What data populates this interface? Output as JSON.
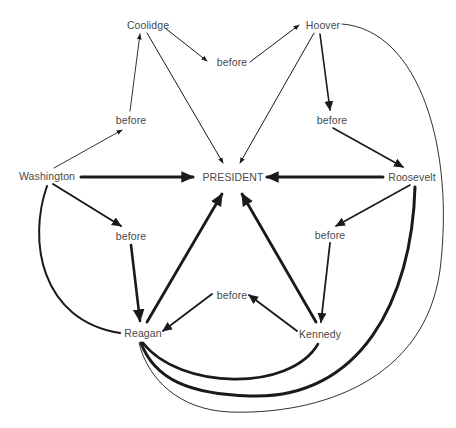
{
  "diagram": {
    "type": "semantic-network",
    "center_node": "PRESIDENT",
    "nodes": [
      {
        "id": "coolidge",
        "label": "Coolidge",
        "x": 148,
        "y": 25
      },
      {
        "id": "hoover",
        "label": "Hoover",
        "x": 323,
        "y": 25
      },
      {
        "id": "before_top",
        "label": "before",
        "x": 232,
        "y": 62
      },
      {
        "id": "before_left",
        "label": "before",
        "x": 131,
        "y": 120
      },
      {
        "id": "before_right",
        "label": "before",
        "x": 332,
        "y": 120
      },
      {
        "id": "washington",
        "label": "Washington",
        "x": 47,
        "y": 176
      },
      {
        "id": "president",
        "label": "PRESIDENT",
        "x": 233,
        "y": 177
      },
      {
        "id": "roosevelt",
        "label": "Roosevelt",
        "x": 412,
        "y": 177
      },
      {
        "id": "before_lower_left",
        "label": "before",
        "x": 131,
        "y": 236
      },
      {
        "id": "before_lower_right",
        "label": "before",
        "x": 330,
        "y": 235
      },
      {
        "id": "before_bottom",
        "label": "before",
        "x": 232,
        "y": 295
      },
      {
        "id": "reagan",
        "label": "Reagan",
        "x": 143,
        "y": 333
      },
      {
        "id": "kennedy",
        "label": "Kennedy",
        "x": 320,
        "y": 334
      }
    ],
    "edges": [
      {
        "from": "coolidge",
        "to": "before_top",
        "weight": "thin"
      },
      {
        "from": "before_top",
        "to": "hoover",
        "weight": "thin"
      },
      {
        "from": "coolidge",
        "to": "president",
        "weight": "thin"
      },
      {
        "from": "hoover",
        "to": "president",
        "weight": "thin"
      },
      {
        "from": "washington",
        "to": "before_left",
        "weight": "thin"
      },
      {
        "from": "before_left",
        "to": "coolidge",
        "weight": "thin"
      },
      {
        "from": "hoover",
        "to": "before_right",
        "weight": "medium"
      },
      {
        "from": "before_right",
        "to": "roosevelt",
        "weight": "medium"
      },
      {
        "from": "washington",
        "to": "president",
        "weight": "thick"
      },
      {
        "from": "roosevelt",
        "to": "president",
        "weight": "thick"
      },
      {
        "from": "washington",
        "to": "before_lower_left",
        "weight": "medium"
      },
      {
        "from": "before_lower_left",
        "to": "reagan",
        "weight": "thick"
      },
      {
        "from": "roosevelt",
        "to": "before_lower_right",
        "weight": "medium"
      },
      {
        "from": "before_lower_right",
        "to": "kennedy",
        "weight": "medium"
      },
      {
        "from": "reagan",
        "to": "president",
        "weight": "thick"
      },
      {
        "from": "kennedy",
        "to": "president",
        "weight": "thick"
      },
      {
        "from": "kennedy",
        "to": "before_bottom",
        "weight": "medium"
      },
      {
        "from": "before_bottom",
        "to": "reagan",
        "weight": "medium"
      },
      {
        "from": "washington",
        "to": "reagan",
        "weight": "medium",
        "style": "curve"
      },
      {
        "from": "kennedy",
        "to": "reagan",
        "weight": "thick",
        "style": "curve"
      },
      {
        "from": "roosevelt",
        "to": "reagan",
        "weight": "thick",
        "style": "curve"
      },
      {
        "from": "hoover",
        "to": "reagan",
        "weight": "thin",
        "style": "curve"
      }
    ],
    "colors": {
      "line": "#1a1a1a",
      "text": "#4a4a4a",
      "background": "#ffffff"
    }
  }
}
